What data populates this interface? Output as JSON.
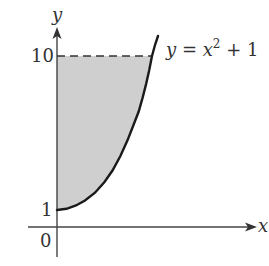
{
  "diagram": {
    "x_axis_label": "x",
    "y_axis_label": "y",
    "tick_labels": {
      "y_top": "10",
      "y_vertex": "1",
      "origin": "0"
    },
    "curve_label": {
      "lhs": "y = x",
      "exponent": "2",
      "rhs": " + 1"
    },
    "curve_equation": "y = x^2 + 1",
    "shaded_region": "region between y-axis, curve y = x^2 + 1, and line y = 10 (x >= 0)",
    "dashed_line_value": 10,
    "colors": {
      "shading": "#cfcfcf",
      "curve": "#1a1a1a",
      "axes": "#444444",
      "text": "#333333"
    }
  }
}
